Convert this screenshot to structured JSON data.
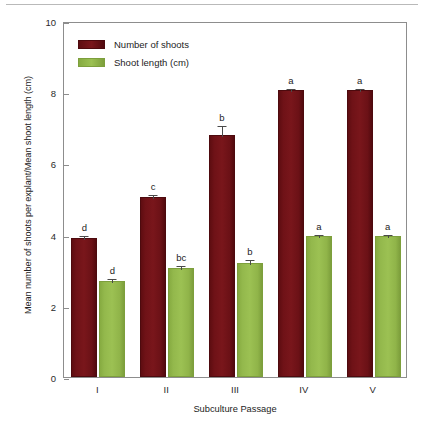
{
  "chart_data": {
    "type": "bar",
    "title": "",
    "subtitle": "",
    "xlabel": "Subculture Passage",
    "ylabel": "Mean number of shoots per explant/Mean shoot length (cm)",
    "categories": [
      "I",
      "II",
      "III",
      "IV",
      "V"
    ],
    "ylim": [
      0,
      10
    ],
    "yticks": [
      0,
      2,
      4,
      6,
      8,
      10
    ],
    "ytick_labels": [
      "0",
      "2",
      "4",
      "6",
      "8",
      "10"
    ],
    "grid": false,
    "legend_position": "top-left",
    "series": [
      {
        "name": "Number of shoots",
        "color": "#6F1217",
        "values": [
          3.9,
          5.05,
          6.8,
          8.05,
          8.05
        ],
        "errors": [
          0.12,
          0.12,
          0.3,
          0.1,
          0.1
        ],
        "letters": [
          "d",
          "c",
          "b",
          "a",
          "a"
        ]
      },
      {
        "name": "Shoot length (cm)",
        "color": "#9CC153",
        "values": [
          2.7,
          3.05,
          3.2,
          3.95,
          3.95
        ],
        "errors": [
          0.1,
          0.12,
          0.14,
          0.1,
          0.1
        ],
        "letters": [
          "d",
          "bc",
          "b",
          "a",
          "a"
        ]
      }
    ],
    "annotations": {
      "letters_meaning": "lowercase letters above error bars denote significance groups"
    }
  },
  "legend": {
    "items": [
      {
        "label": "Number of shoots",
        "swatch": "shoots"
      },
      {
        "label": "Shoot length (cm)",
        "swatch": "length"
      }
    ]
  }
}
